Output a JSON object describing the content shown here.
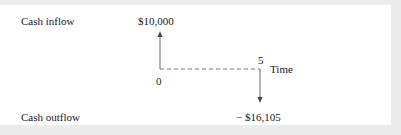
{
  "diagram": {
    "labels": {
      "cash_inflow": "Cash inflow",
      "cash_outflow": "Cash outflow",
      "time_axis": "Time"
    },
    "timeline": {
      "start_period": "0",
      "end_period": "5"
    },
    "flows": [
      {
        "period": 0,
        "direction": "inflow",
        "amount_label": "$10,000",
        "amount": 10000
      },
      {
        "period": 5,
        "direction": "outflow",
        "amount_label": "− $16,105",
        "amount": -16105
      }
    ],
    "colors": {
      "line": "#444444",
      "text": "#1a1a1a",
      "frame": "#ececec",
      "panel": "#ffffff"
    }
  }
}
